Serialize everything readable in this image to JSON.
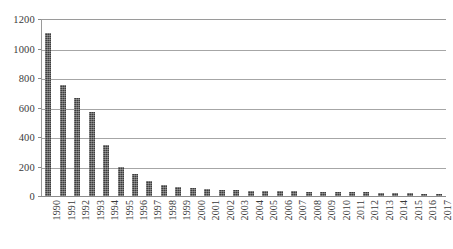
{
  "chart_data": {
    "type": "bar",
    "title": "",
    "subtitle": "",
    "xlabel": "",
    "ylabel": "",
    "categories": [
      "1990",
      "1991",
      "1992",
      "1993",
      "1994",
      "1995",
      "1996",
      "1997",
      "1998",
      "1999",
      "2000",
      "2001",
      "2002",
      "2003",
      "2004",
      "2005",
      "2006",
      "2007",
      "2008",
      "2009",
      "2010",
      "2011",
      "2012",
      "2013",
      "2014",
      "2015",
      "2016",
      "2017"
    ],
    "values": [
      1105,
      753,
      665,
      570,
      345,
      200,
      148,
      100,
      72,
      60,
      52,
      45,
      40,
      38,
      36,
      35,
      36,
      32,
      30,
      28,
      26,
      24,
      24,
      22,
      20,
      18,
      12,
      12
    ],
    "ylim": [
      0,
      1200
    ],
    "yticks": [
      0,
      200,
      400,
      600,
      800,
      1000,
      1200
    ],
    "ytick_labels": [
      "0",
      "200",
      "400",
      "600",
      "800",
      "1000",
      "1200"
    ],
    "grid": "horizontal",
    "legend": "none",
    "series_name": "",
    "bar_color": "#3d3d3d",
    "grid_color": "#a6a6a6",
    "axis_color": "#8c8c8c",
    "background": "#ffffff"
  }
}
